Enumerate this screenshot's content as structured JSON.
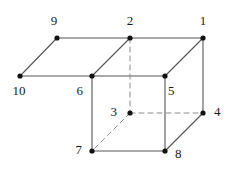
{
  "figure": {
    "canvas": {
      "width": 227,
      "height": 171,
      "background": "#ffffff"
    },
    "style": {
      "solid_edge_color": "#555555",
      "hidden_edge_color": "#8c8c8c",
      "vertex_color": "#111111",
      "label_color": "#1a1a1a",
      "edge_width": 1.1,
      "hidden_edge_width": 1.0,
      "hidden_edge_dash": "5,4",
      "vertex_radius": 2.6,
      "label_font_size": 13
    },
    "vertices": [
      {
        "id": "1",
        "x": 203,
        "y": 38,
        "label": "1",
        "label_x": 203,
        "label_y": 22,
        "label_anchor": "middle",
        "hidden": false
      },
      {
        "id": "2",
        "x": 130,
        "y": 38,
        "label": "2",
        "label_x": 130,
        "label_y": 22,
        "label_anchor": "middle",
        "hidden": false
      },
      {
        "id": "3",
        "x": 130,
        "y": 113,
        "label": "3",
        "label_x": 117,
        "label_y": 113,
        "label_anchor": "end",
        "hidden": true
      },
      {
        "id": "4",
        "x": 203,
        "y": 113,
        "label": "4",
        "label_x": 214,
        "label_y": 113,
        "label_anchor": "start",
        "hidden": false
      },
      {
        "id": "5",
        "x": 165,
        "y": 76,
        "label": "5",
        "label_x": 168,
        "label_y": 92,
        "label_anchor": "start",
        "hidden": false
      },
      {
        "id": "6",
        "x": 92,
        "y": 76,
        "label": "6",
        "label_x": 83,
        "label_y": 92,
        "label_anchor": "end",
        "hidden": false
      },
      {
        "id": "7",
        "x": 92,
        "y": 151,
        "label": "7",
        "label_x": 82,
        "label_y": 151,
        "label_anchor": "end",
        "hidden": false
      },
      {
        "id": "8",
        "x": 165,
        "y": 151,
        "label": "8",
        "label_x": 175,
        "label_y": 155,
        "label_anchor": "start",
        "hidden": false
      },
      {
        "id": "9",
        "x": 57,
        "y": 38,
        "label": "9",
        "label_x": 54,
        "label_y": 22,
        "label_anchor": "middle",
        "hidden": false
      },
      {
        "id": "10",
        "x": 20,
        "y": 76,
        "label": "10",
        "label_x": 19,
        "label_y": 92,
        "label_anchor": "middle",
        "hidden": false
      }
    ],
    "edges": [
      {
        "from": "9",
        "to": "2",
        "style": "solid"
      },
      {
        "from": "2",
        "to": "1",
        "style": "solid"
      },
      {
        "from": "9",
        "to": "10",
        "style": "solid"
      },
      {
        "from": "10",
        "to": "6",
        "style": "solid"
      },
      {
        "from": "6",
        "to": "5",
        "style": "solid"
      },
      {
        "from": "2",
        "to": "6",
        "style": "solid"
      },
      {
        "from": "1",
        "to": "5",
        "style": "solid"
      },
      {
        "from": "1",
        "to": "4",
        "style": "solid"
      },
      {
        "from": "6",
        "to": "7",
        "style": "solid"
      },
      {
        "from": "5",
        "to": "8",
        "style": "solid"
      },
      {
        "from": "7",
        "to": "8",
        "style": "solid"
      },
      {
        "from": "8",
        "to": "4",
        "style": "solid"
      },
      {
        "from": "2",
        "to": "3",
        "style": "dashed"
      },
      {
        "from": "3",
        "to": "4",
        "style": "dashed"
      },
      {
        "from": "3",
        "to": "7",
        "style": "dashed"
      }
    ]
  }
}
